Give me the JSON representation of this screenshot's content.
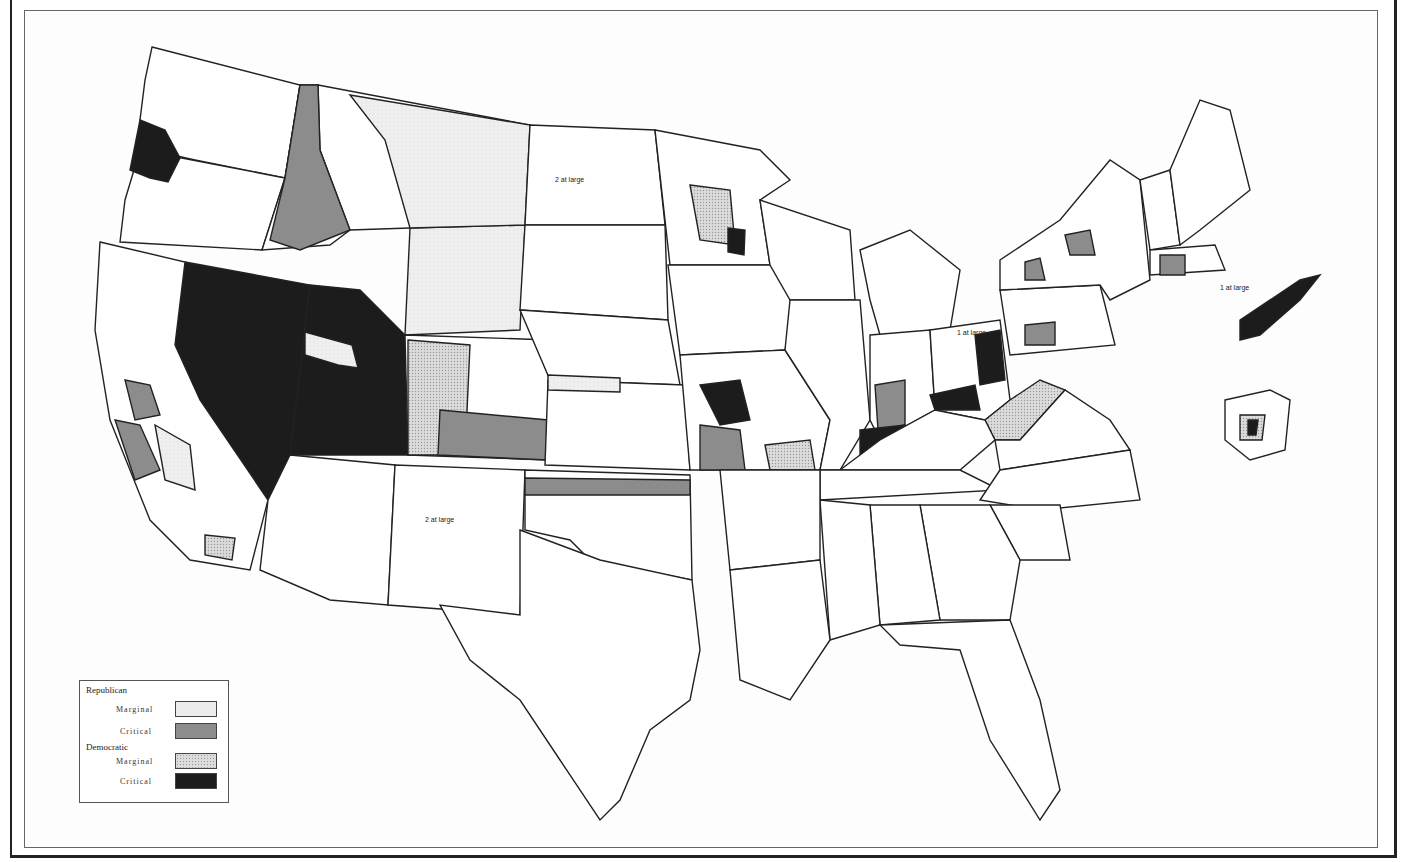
{
  "legend": {
    "groups": [
      {
        "title": "Republican",
        "items": [
          {
            "label": "Marginal",
            "color": "#ececec",
            "pattern": "light-stipple"
          },
          {
            "label": "Critical",
            "color": "#8c8c8c",
            "pattern": "solid-gray"
          }
        ]
      },
      {
        "title": "Democratic",
        "items": [
          {
            "label": "Marginal",
            "color": "#dcdcdc",
            "pattern": "dotted"
          },
          {
            "label": "Critical",
            "color": "#1c1c1c",
            "pattern": "solid-black"
          }
        ]
      }
    ]
  },
  "map": {
    "subject": "Congressional districts of the United States, shaded by party and margin",
    "labels": {
      "nd": "2 at large",
      "nm": "2 at large",
      "ct_at_large": "1 at large",
      "oh_at_large": "1 at large",
      "wa": [
        "2",
        "6",
        "3",
        "4"
      ],
      "or": [
        "4",
        "2"
      ],
      "id": [
        "1",
        "2"
      ],
      "mt": [
        "1",
        "2"
      ],
      "wy": "1",
      "ut": [
        "2"
      ],
      "co": [
        "4",
        "3",
        "1",
        "2"
      ],
      "ca": [
        "2",
        "3",
        "8",
        "10",
        "11",
        "21",
        "22",
        "23"
      ],
      "az": [
        "2",
        "1"
      ],
      "sd": [
        "2",
        "1"
      ],
      "ne": [
        "4",
        "3"
      ],
      "ks": [
        "6",
        "5",
        "4",
        "1"
      ],
      "ok": [
        "8",
        "1",
        "7",
        "6",
        "5",
        "4"
      ],
      "tx": [
        "18",
        "19",
        "13",
        "17",
        "12",
        "21",
        "16",
        "20",
        "14",
        "15"
      ],
      "mn": [
        "9",
        "8",
        "7",
        "6",
        "2",
        "1",
        "3"
      ],
      "ny": [
        "34",
        "31",
        "33",
        "32",
        "35",
        "36",
        "38",
        "41",
        "42",
        "44",
        "43",
        "39",
        "37",
        "30",
        "29"
      ],
      "pa": [
        "28",
        "19",
        "25",
        "26",
        "27",
        "24",
        "23",
        "22",
        "14",
        "20"
      ],
      "oh": [
        "5",
        "6",
        "4",
        "8",
        "7",
        "13",
        "15",
        "11",
        "10",
        "12",
        "3",
        "9",
        "2"
      ],
      "ma": [
        "1",
        "2",
        "3",
        "4",
        "5",
        "6",
        "7",
        "8",
        "9",
        "10",
        "11"
      ],
      "nj": [
        "6",
        "8",
        "9",
        "10"
      ]
    },
    "colors": {
      "rep_marginal": "#ececec",
      "rep_critical": "#8c8c8c",
      "dem_marginal": "#dcdcdc",
      "dem_critical": "#1c1c1c",
      "uncontested": "#ffffff",
      "border": "#222222"
    }
  }
}
